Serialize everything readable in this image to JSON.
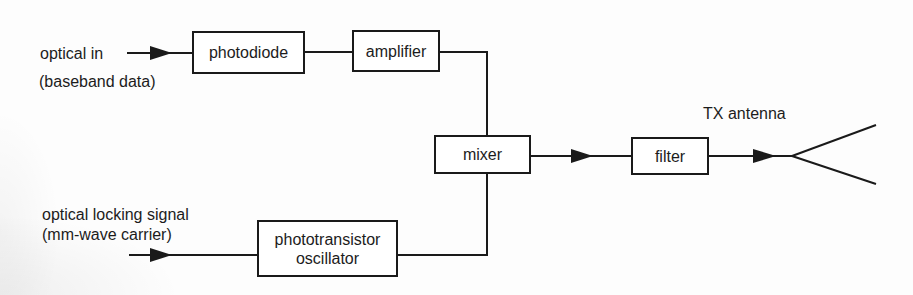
{
  "diagram": {
    "type": "block-diagram",
    "colors": {
      "line": "#1a1a1a",
      "text": "#1c1c1c",
      "background": "#fdfdfd"
    },
    "inputs": {
      "optical_in": {
        "line1": "optical in",
        "line2": "(baseband data)"
      },
      "optical_locking": {
        "line1": "optical locking signal",
        "line2": "(mm-wave carrier)"
      }
    },
    "blocks": {
      "photodiode": {
        "label": "photodiode"
      },
      "amplifier": {
        "label": "amplifier"
      },
      "mixer": {
        "label": "mixer"
      },
      "filter": {
        "label": "filter"
      },
      "phototransistor_oscillator": {
        "line1": "phototransistor",
        "line2": "oscillator"
      }
    },
    "output": {
      "antenna_label": "TX antenna"
    },
    "connections": [
      {
        "from": "optical_in",
        "to": "photodiode",
        "arrow": true
      },
      {
        "from": "photodiode",
        "to": "amplifier",
        "arrow": false
      },
      {
        "from": "amplifier",
        "to": "mixer",
        "arrow": false
      },
      {
        "from": "optical_locking",
        "to": "phototransistor_oscillator",
        "arrow": true
      },
      {
        "from": "phototransistor_oscillator",
        "to": "mixer",
        "arrow": false
      },
      {
        "from": "mixer",
        "to": "filter",
        "arrow": true
      },
      {
        "from": "filter",
        "to": "tx_antenna",
        "arrow": true
      }
    ]
  }
}
